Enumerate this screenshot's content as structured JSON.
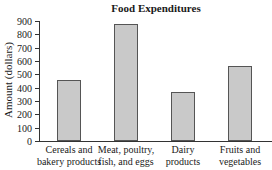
{
  "chart_data": {
    "type": "bar",
    "title": "Food Expenditures",
    "xlabel": "",
    "ylabel": "Amount (dollars)",
    "ylim": [
      0,
      900
    ],
    "yticks": [
      0,
      100,
      200,
      300,
      400,
      500,
      600,
      700,
      800,
      900
    ],
    "grid": false,
    "categories": [
      "Cereals and bakery products",
      "Meat, poultry, fish, and eggs",
      "Dairy products",
      "Fruits and vegetables"
    ],
    "category_lines": [
      [
        "Cereals and",
        "bakery products"
      ],
      [
        "Meat, poultry,",
        "fish, and eggs"
      ],
      [
        "Dairy",
        "products"
      ],
      [
        "Fruits and",
        "vegetables"
      ]
    ],
    "values": [
      460,
      880,
      370,
      560
    ],
    "bar_color": "#c9c9c9"
  }
}
